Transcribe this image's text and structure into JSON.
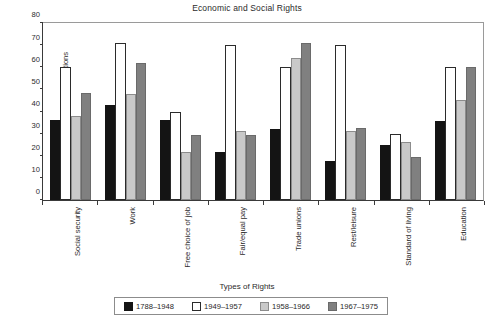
{
  "chart_data": {
    "type": "bar",
    "title": "Economic and Social Rights",
    "xlabel": "Types of Rights",
    "ylabel": "Percentage of National Constitutions",
    "ylim": [
      0,
      80
    ],
    "ytick_step": 10,
    "yticks": [
      0,
      10,
      20,
      30,
      40,
      50,
      60,
      70,
      80
    ],
    "grid": false,
    "legend_position": "bottom",
    "categories": [
      "Social security",
      "Work",
      "Free choice of job",
      "Fair/equal pay",
      "Trade unions",
      "Rest/leisure",
      "Standard of living",
      "Education"
    ],
    "series": [
      {
        "name": "1788–1948",
        "color": "#141414",
        "values": [
          36,
          43,
          36,
          21.5,
          32,
          17.5,
          25,
          35.5
        ]
      },
      {
        "name": "1949–1957",
        "color": "#ffffff",
        "values": [
          60,
          71,
          40,
          70,
          60,
          70,
          30,
          60
        ]
      },
      {
        "name": "1958–1966",
        "color": "#c9c9c9",
        "values": [
          38,
          48,
          21.5,
          31,
          64,
          31,
          26,
          45
        ]
      },
      {
        "name": "1967–1975",
        "color": "#808080",
        "values": [
          48.5,
          62,
          29.5,
          29.5,
          71,
          32.5,
          19.5,
          60
        ]
      }
    ]
  },
  "legend": {
    "items": [
      {
        "label": "1788–1948"
      },
      {
        "label": "1949–1957"
      },
      {
        "label": "1958–1966"
      },
      {
        "label": "1967–1975"
      }
    ]
  }
}
